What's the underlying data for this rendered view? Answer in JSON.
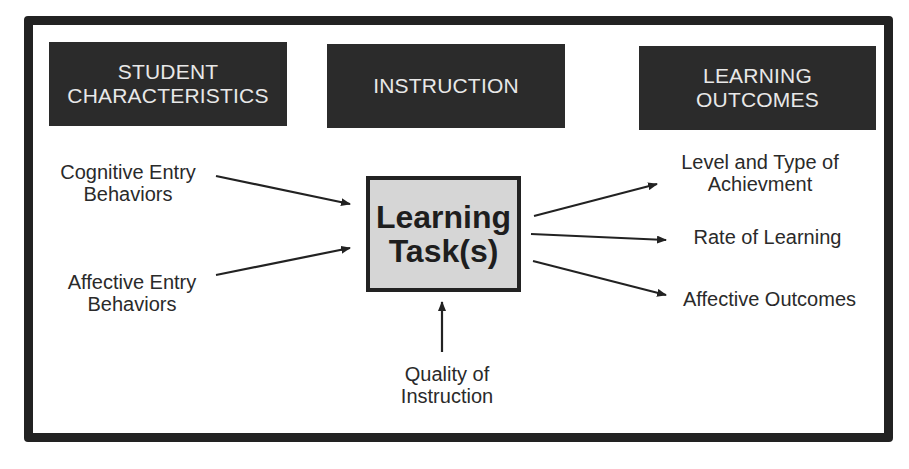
{
  "headers": {
    "student": {
      "line1": "STUDENT",
      "line2": "CHARACTERISTICS"
    },
    "instruction": {
      "line1": "INSTRUCTION"
    },
    "outcomes": {
      "line1": "LEARNING",
      "line2": "OUTCOMES"
    }
  },
  "center": {
    "line1": "Learning",
    "line2": "Task(s)"
  },
  "inputs": {
    "cognitive": {
      "line1": "Cognitive Entry",
      "line2": "Behaviors"
    },
    "affective": {
      "line1": "Affective Entry",
      "line2": "Behaviors"
    },
    "quality": {
      "line1": "Quality of",
      "line2": "Instruction"
    }
  },
  "outputs": {
    "achievement": {
      "line1": "Level and Type of",
      "line2": "Achievment"
    },
    "rate": {
      "line1": "Rate of Learning"
    },
    "affective": {
      "line1": "Affective Outcomes"
    }
  },
  "colors": {
    "frame": "#222222",
    "header_bg": "#2b2b2b",
    "header_text": "#e8e8e8",
    "center_bg": "#d6d6d6"
  }
}
